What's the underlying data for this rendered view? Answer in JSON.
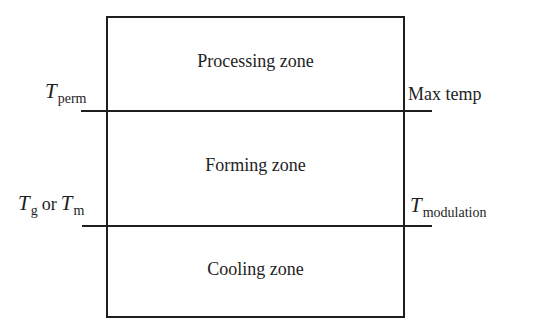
{
  "diagram": {
    "type": "temperature-zone-diagram",
    "zones": [
      {
        "id": "processing",
        "label": "Processing zone"
      },
      {
        "id": "forming",
        "label": "Forming zone"
      },
      {
        "id": "cooling",
        "label": "Cooling zone"
      }
    ],
    "boundaries": [
      {
        "id": "upper",
        "left_label": {
          "symbol": "T",
          "subscript": "perm"
        },
        "right_label": {
          "text": "Max temp"
        }
      },
      {
        "id": "lower",
        "left_label": {
          "symbol1": "T",
          "subscript1": "g",
          "conjunction": "or",
          "symbol2": "T",
          "subscript2": "m"
        },
        "right_label": {
          "symbol": "T",
          "subscript": "modulation"
        }
      }
    ],
    "line_color": "#1e1e1e",
    "background_color": "#ffffff"
  }
}
